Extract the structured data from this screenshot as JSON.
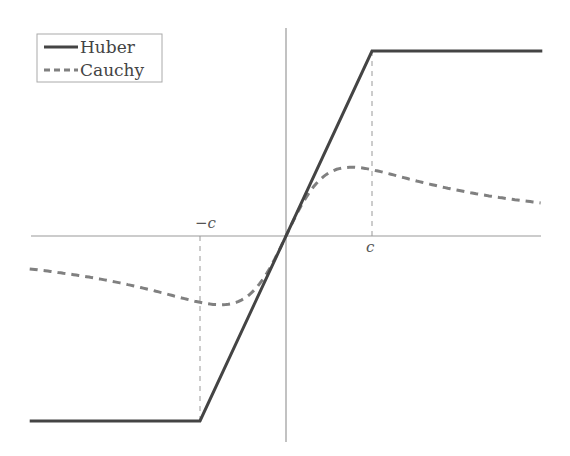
{
  "chart_data": {
    "type": "line",
    "title": "",
    "xlabel": "",
    "ylabel": "",
    "x_tick_labels": [
      "-c",
      "c"
    ],
    "grid": false,
    "legend": {
      "position": "upper left",
      "entries": [
        "Huber",
        "Cauchy"
      ]
    },
    "params": {
      "c": 1.0
    },
    "series": [
      {
        "name": "Huber",
        "style": "solid",
        "color": "#444444",
        "x": [
          -2.98,
          -1.0,
          1.0,
          2.98
        ],
        "y": [
          -2.15,
          -2.15,
          2.15,
          2.15
        ]
      },
      {
        "name": "Cauchy",
        "style": "dashed",
        "color": "#777777",
        "x": [
          -2.98,
          -2.5,
          -2.0,
          -1.5,
          -1.0,
          -0.76,
          -0.5,
          -0.25,
          0.0,
          0.25,
          0.5,
          0.76,
          1.0,
          1.5,
          2.0,
          2.5,
          2.98
        ],
        "y": [
          -0.38,
          -0.44,
          -0.53,
          -0.66,
          -0.78,
          -0.8,
          -0.7,
          -0.42,
          0.0,
          0.42,
          0.7,
          0.8,
          0.78,
          0.66,
          0.53,
          0.44,
          0.38
        ]
      }
    ],
    "annotations": [
      {
        "type": "vline-dashed",
        "x": -1.0,
        "label": "-c"
      },
      {
        "type": "vline-dashed",
        "x": 1.0,
        "label": "c"
      }
    ]
  },
  "labels": {
    "neg_c": "−c",
    "pos_c": "c"
  },
  "legend": {
    "huber": "Huber",
    "cauchy": "Cauchy"
  }
}
